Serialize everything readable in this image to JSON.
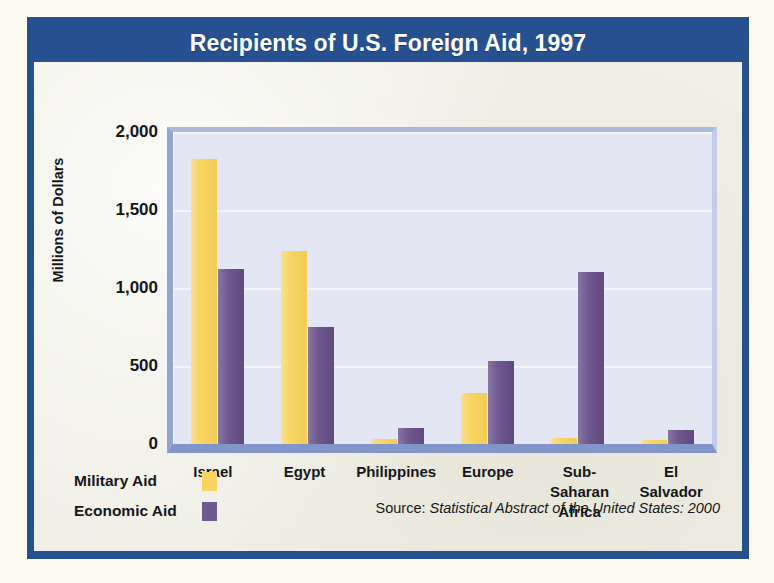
{
  "chart_data": {
    "type": "bar",
    "title": "Recipients of U.S. Foreign Aid, 1997",
    "xlabel": "",
    "ylabel": "Millions of Dollars",
    "ylim": [
      0,
      2000
    ],
    "ytick_values": [
      2000,
      1500,
      1000,
      500,
      0
    ],
    "ytick_labels": [
      "2,000",
      "1,500",
      "1,000",
      "500",
      "0"
    ],
    "grid": true,
    "legend_position": "below-left",
    "categories": [
      "Israel",
      "Egypt",
      "Philippines",
      "Europe",
      "Sub-Saharan\nAfrica",
      "El\nSalvador"
    ],
    "categories_flat": [
      "Israel",
      "Egypt",
      "Philippines",
      "Europe",
      "Sub-Saharan Africa",
      "El Salvador"
    ],
    "series": [
      {
        "name": "Military Aid",
        "color": "#f7d560",
        "values": [
          1825,
          1240,
          30,
          330,
          40,
          25
        ]
      },
      {
        "name": "Economic Aid",
        "color": "#6f5790",
        "values": [
          1125,
          750,
          100,
          530,
          1100,
          90
        ]
      }
    ],
    "source_prefix": "Source: ",
    "source_title": "Statistical Abstract of the United States: 2000"
  },
  "style": {
    "frame_color": "#26508f",
    "panel_color": "#f0efe6",
    "plot_background": "#e4e7f3",
    "military_color": "#f7d560",
    "economic_color": "#6f5790",
    "text_color": "#15171a",
    "title_color": "#ffffff"
  }
}
